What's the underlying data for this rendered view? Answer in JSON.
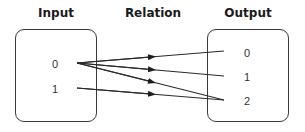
{
  "titles": {
    "input": "Input",
    "relation": "Relation",
    "output": "Output"
  },
  "input_set": {
    "elements": [
      "0",
      "1"
    ]
  },
  "output_set": {
    "elements": [
      "0",
      "1",
      "2"
    ]
  },
  "relation": {
    "pairs": [
      {
        "from": "0",
        "to": "0"
      },
      {
        "from": "0",
        "to": "1"
      },
      {
        "from": "0",
        "to": "2"
      },
      {
        "from": "1",
        "to": "2"
      }
    ]
  },
  "colors": {
    "line": "#2b2b2b",
    "box_border": "#3a3a3a",
    "text": "#333333",
    "title": "#1a1a1a"
  }
}
